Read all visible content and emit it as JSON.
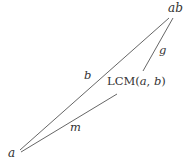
{
  "diagram": {
    "type": "lattice-triangle",
    "nodes": {
      "top": {
        "label": "ab"
      },
      "bottom": {
        "label": "a"
      },
      "middle": {
        "label_prefix": "LCM(",
        "arg1": "a",
        "sep": ", ",
        "arg2": "b",
        "label_suffix": ")"
      }
    },
    "edges": {
      "a_to_ab": {
        "label": "b"
      },
      "lcm_to_ab": {
        "label": "g"
      },
      "a_to_lcm": {
        "label": "m"
      }
    },
    "colors": {
      "line": "#555555",
      "text": "#333333"
    }
  }
}
